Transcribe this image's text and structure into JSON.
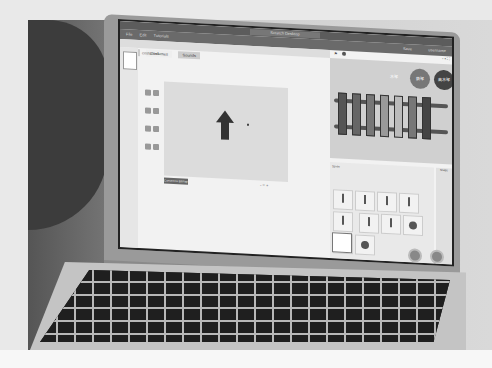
{
  "photo": {
    "subject": "laptop showing block-based programming editor",
    "laptop_brand_label": "MacBook Air"
  },
  "editor": {
    "window_title": "Scratch Desktop",
    "menu": [
      "File",
      "Edit",
      "Tutorials"
    ],
    "save_label": "Save",
    "user_label": "username",
    "tabs": [
      "Code",
      "Costumes",
      "Sounds"
    ],
    "active_tab": "Costumes",
    "paint": {
      "costume_name": "costume1",
      "convert_button": "Convert to Bitmap",
      "zoom_controls": [
        "-",
        "=",
        "+"
      ]
    },
    "stage": {
      "xylophone_label": "木琴",
      "button_a": "鉄琴",
      "button_b": "高木琴"
    },
    "sprite_panel": {
      "sprite_label": "Sprite",
      "selected_sprite": "Sprite1",
      "stage_label": "Stage"
    }
  }
}
